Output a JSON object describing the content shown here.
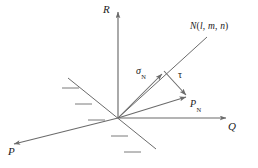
{
  "figure": {
    "type": "3d-stress-vector-diagram",
    "background_color": "#ffffff",
    "line_color": "#6b6b6b",
    "text_color": "#1a1a1a",
    "axes": [
      {
        "id": "R",
        "label": "R",
        "description": "vertical axis pointing up",
        "label_x": 103,
        "label_y": 4
      },
      {
        "id": "Q",
        "label": "Q",
        "description": "axis pointing right",
        "label_x": 228,
        "label_y": 122
      },
      {
        "id": "P",
        "label": "P",
        "description": "axis pointing down-left toward viewer",
        "label_x": 8,
        "label_y": 147
      }
    ],
    "vectors": [
      {
        "id": "N",
        "label": "N",
        "args": [
          "l",
          "m",
          "n"
        ],
        "label_full": "N(l, m, n)",
        "description": "unit normal direction ray from origin to upper right",
        "label_x": 190,
        "label_y": 22
      },
      {
        "id": "sigma_N",
        "label": "σ",
        "subscript": "N",
        "description": "normal stress component along N",
        "label_x": 136,
        "label_y": 66
      },
      {
        "id": "tau",
        "label": "τ",
        "description": "shear stress component perpendicular to N",
        "label_x": 178,
        "label_y": 70
      },
      {
        "id": "P_N",
        "label": "P",
        "subscript": "N",
        "description": "resultant stress vector on the plane",
        "label_x": 190,
        "label_y": 99
      }
    ],
    "plane_trace": {
      "description": "hatched line representing the trace of the inclined plane through the origin",
      "hatch_count": 5
    },
    "origin": {
      "x": 118,
      "y": 118
    }
  }
}
